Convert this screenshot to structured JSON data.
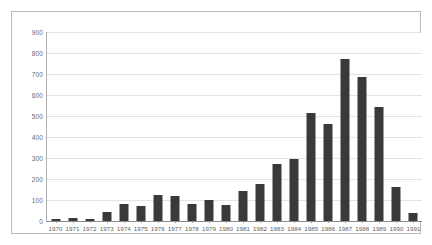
{
  "chart_data": {
    "type": "bar",
    "title": "",
    "subtitle": "",
    "xlabel": "",
    "ylabel": "",
    "categories": [
      "1970",
      "1971",
      "1972",
      "1973",
      "1974",
      "1975",
      "1976",
      "1977",
      "1978",
      "1979",
      "1980",
      "1981",
      "1982",
      "1983",
      "1984",
      "1985",
      "1986",
      "1987",
      "1988",
      "1989",
      "1990",
      "1991"
    ],
    "values": [
      10,
      15,
      10,
      45,
      80,
      73,
      125,
      120,
      82,
      100,
      75,
      142,
      178,
      272,
      293,
      512,
      460,
      770,
      685,
      545,
      160,
      40
    ],
    "ylim": [
      0,
      900
    ],
    "ytick_values": [
      0,
      100,
      200,
      300,
      400,
      500,
      600,
      700,
      800,
      900
    ],
    "ytick_labels": [
      "0",
      "100",
      "200",
      "300",
      "400",
      "500",
      "600",
      "700",
      "800",
      "900"
    ],
    "grid": true,
    "grid_axis": "y",
    "legend": false,
    "legend_position": "none",
    "series": [
      {
        "name": "",
        "values": [
          10,
          15,
          10,
          45,
          80,
          73,
          125,
          120,
          82,
          100,
          75,
          142,
          178,
          272,
          293,
          512,
          460,
          770,
          685,
          545,
          160,
          40
        ]
      }
    ]
  },
  "style": {
    "bar_color": "#3a3a3a",
    "grid_color": "#e3e3e3",
    "axis_color": "#8c8c8c",
    "frame_color": "#b9b9b9",
    "background": "#ffffff",
    "tick_text_color": "#6b6b6b"
  }
}
